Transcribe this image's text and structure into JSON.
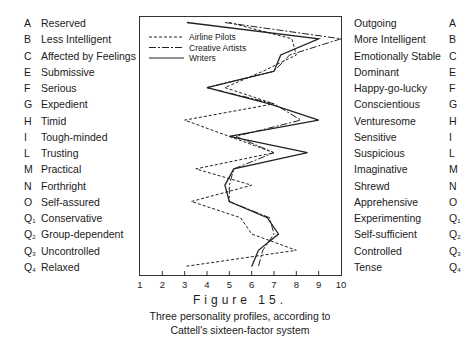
{
  "figure": {
    "title": "Figure 15.",
    "subtitle_line1": "Three personality profiles, according to",
    "subtitle_line2": "Cattell's sixteen-factor system"
  },
  "legend": [
    {
      "label": "Airline Pilots",
      "style": "dashed"
    },
    {
      "label": "Creative Artists",
      "style": "dash-dot"
    },
    {
      "label": "Writers",
      "style": "solid"
    }
  ],
  "factors": [
    {
      "code": "A",
      "sub": "",
      "low": "Reserved",
      "high": "Outgoing"
    },
    {
      "code": "B",
      "sub": "",
      "low": "Less Intelligent",
      "high": "More Intelligent"
    },
    {
      "code": "C",
      "sub": "",
      "low": "Affected by Feelings",
      "high": "Emotionally Stable"
    },
    {
      "code": "E",
      "sub": "",
      "low": "Submissive",
      "high": "Dominant"
    },
    {
      "code": "F",
      "sub": "",
      "low": "Serious",
      "high": "Happy-go-lucky"
    },
    {
      "code": "G",
      "sub": "",
      "low": "Expedient",
      "high": "Conscientious"
    },
    {
      "code": "H",
      "sub": "",
      "low": "Timid",
      "high": "Venturesome"
    },
    {
      "code": "I",
      "sub": "",
      "low": "Tough-minded",
      "high": "Sensitive"
    },
    {
      "code": "L",
      "sub": "",
      "low": "Trusting",
      "high": "Suspicious"
    },
    {
      "code": "M",
      "sub": "",
      "low": "Practical",
      "high": "Imaginative"
    },
    {
      "code": "N",
      "sub": "",
      "low": "Forthright",
      "high": "Shrewd"
    },
    {
      "code": "O",
      "sub": "",
      "low": "Self-assured",
      "high": "Apprehensive"
    },
    {
      "code": "Q",
      "sub": "1",
      "low": "Conservative",
      "high": "Experimenting"
    },
    {
      "code": "Q",
      "sub": "2",
      "low": "Group-dependent",
      "high": "Self-sufficient"
    },
    {
      "code": "Q",
      "sub": "3",
      "low": "Uncontrolled",
      "high": "Controlled"
    },
    {
      "code": "Q",
      "sub": "4",
      "low": "Relaxed",
      "high": "Tense"
    }
  ],
  "x_ticks": [
    "1",
    "2",
    "3",
    "4",
    "5",
    "6",
    "7",
    "8",
    "9",
    "10"
  ],
  "chart_data": {
    "type": "line",
    "orientation": "horizontal-profile",
    "xlabel": "",
    "ylabel": "",
    "xlim": [
      1,
      10
    ],
    "x_ticks": [
      1,
      2,
      3,
      4,
      5,
      6,
      7,
      8,
      9,
      10
    ],
    "categories": [
      "A",
      "B",
      "C",
      "E",
      "F",
      "G",
      "H",
      "I",
      "L",
      "M",
      "N",
      "O",
      "Q1",
      "Q2",
      "Q3",
      "Q4"
    ],
    "category_low_labels": [
      "Reserved",
      "Less Intelligent",
      "Affected by Feelings",
      "Submissive",
      "Serious",
      "Expedient",
      "Timid",
      "Tough-minded",
      "Trusting",
      "Practical",
      "Forthright",
      "Self-assured",
      "Conservative",
      "Group-dependent",
      "Uncontrolled",
      "Relaxed"
    ],
    "category_high_labels": [
      "Outgoing",
      "More Intelligent",
      "Emotionally Stable",
      "Dominant",
      "Happy-go-lucky",
      "Conscientious",
      "Venturesome",
      "Sensitive",
      "Suspicious",
      "Imaginative",
      "Shrewd",
      "Apprehensive",
      "Experimenting",
      "Self-sufficient",
      "Controlled",
      "Tense"
    ],
    "series": [
      {
        "name": "Airline Pilots",
        "style": "dashed",
        "values": [
          5.0,
          7.8,
          8.0,
          6.5,
          4.8,
          7.0,
          3.0,
          5.0,
          7.0,
          3.5,
          6.0,
          3.3,
          5.5,
          6.0,
          8.0,
          3.0
        ]
      },
      {
        "name": "Creative Artists",
        "style": "dash-dot",
        "values": [
          4.8,
          10.0,
          7.7,
          7.0,
          4.0,
          7.0,
          8.2,
          5.3,
          7.0,
          5.2,
          5.0,
          5.0,
          6.8,
          7.0,
          6.5,
          6.3
        ]
      },
      {
        "name": "Writers",
        "style": "solid",
        "values": [
          3.1,
          9.0,
          7.3,
          7.0,
          4.0,
          6.8,
          9.0,
          5.0,
          8.5,
          5.2,
          4.8,
          5.0,
          6.7,
          7.2,
          6.3,
          6.0
        ]
      }
    ],
    "legend_position": "upper-left inside",
    "grid": false
  }
}
